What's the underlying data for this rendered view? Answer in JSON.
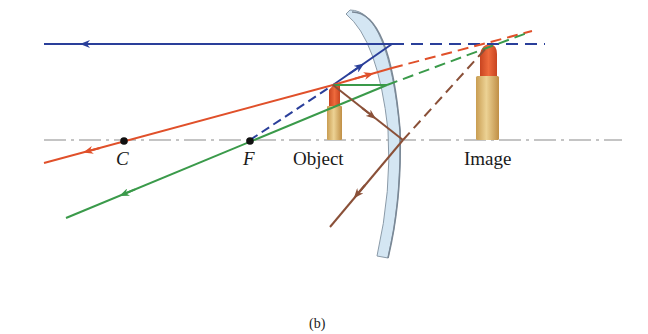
{
  "diagram": {
    "caption": "(b)",
    "labels": {
      "center_of_curvature": "C",
      "focal_point": "F",
      "object": "Object",
      "image": "Image"
    },
    "colors": {
      "ray_blue": "#2a3f9a",
      "ray_red": "#e0502a",
      "ray_green": "#3a9a4a",
      "ray_brown": "#8a5038",
      "axis": "#888888",
      "mirror_fill": "#d4e6f3",
      "mirror_edge": "#8a9aa8",
      "lipstick_tip": "#e05a30",
      "lipstick_body": "#e3c27c"
    },
    "rays": [
      {
        "name": "parallel-ray",
        "color": "blue",
        "description": "Ray through F direction reflects parallel to axis"
      },
      {
        "name": "center-ray",
        "color": "red",
        "description": "Ray toward C reflects back through C"
      },
      {
        "name": "focal-ray",
        "color": "green",
        "description": "Ray parallel to axis reflects as if from F"
      },
      {
        "name": "vertex-ray",
        "color": "brown",
        "description": "Ray to mirror vertex reflects symmetrically"
      }
    ]
  }
}
